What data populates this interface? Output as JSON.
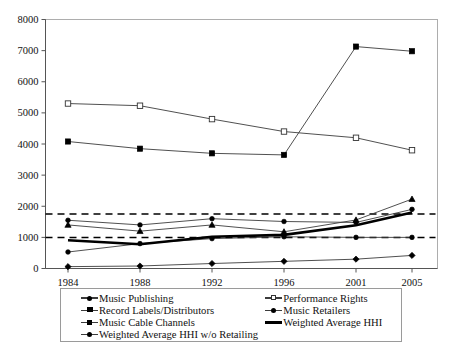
{
  "chart_data": {
    "type": "line",
    "title": "",
    "xlabel": "",
    "ylabel": "",
    "x": [
      1984,
      1988,
      1992,
      1996,
      2001,
      2005
    ],
    "xtick_labels": [
      "1984",
      "1988",
      "1992",
      "1996",
      "2001",
      "2005"
    ],
    "ytick_labels": [
      "0",
      "1000",
      "2000",
      "3000",
      "4000",
      "5000",
      "6000",
      "7000",
      "8000"
    ],
    "ylim": [
      0,
      8000
    ],
    "ytick_step": 1000,
    "grid": false,
    "legend_position": "bottom",
    "series": [
      {
        "name": "Music Publishing",
        "marker": "plus",
        "values": [
          1550,
          1400,
          1600,
          1510,
          1480,
          1900
        ]
      },
      {
        "name": "Performance Rights",
        "marker": "open-square",
        "values": [
          5300,
          5230,
          4800,
          4400,
          4200,
          3800
        ]
      },
      {
        "name": "Record Labels/Distributors",
        "marker": "triangle",
        "values": [
          1400,
          1200,
          1400,
          1180,
          1560,
          2230
        ]
      },
      {
        "name": "Music Retailers",
        "marker": "plus-small",
        "values": [
          530,
          800,
          960,
          1020,
          1000,
          1000
        ]
      },
      {
        "name": "Music Cable Channels",
        "marker": "filled-square",
        "values": [
          4080,
          3850,
          3700,
          3650,
          7130,
          6980
        ]
      },
      {
        "name": "Weighted Average HHI",
        "marker": "none",
        "style": "thick-solid",
        "values": [
          910,
          780,
          1020,
          1080,
          1390,
          1800
        ]
      },
      {
        "name": "Weighted Average HHI w/o Retailing",
        "marker": "diamond",
        "values": [
          60,
          80,
          160,
          230,
          300,
          420
        ]
      }
    ],
    "reference_lines": [
      {
        "value": 1750,
        "style": "dashed"
      },
      {
        "value": 1000,
        "style": "dashed"
      }
    ]
  },
  "legend": {
    "left_column": [
      "Music Publishing",
      "Record Labels/Distributors",
      "Music Cable Channels",
      "Weighted Average HHI w/o Retailing"
    ],
    "right_column": [
      "Performance Rights",
      "Music Retailers",
      "Weighted Average HHI"
    ]
  },
  "colors": {
    "line": "#3c3c3c",
    "thick_line": "#000000",
    "axis": "#555555",
    "border": "#9a9a9a",
    "background": "#ffffff"
  }
}
